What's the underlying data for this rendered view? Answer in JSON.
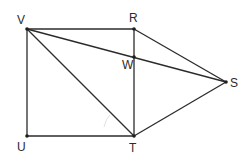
{
  "figure": {
    "type": "geometry",
    "points": {
      "V": {
        "x": 27,
        "y": 29,
        "label": "V",
        "lx": 17,
        "ly": 24
      },
      "R": {
        "x": 134,
        "y": 29,
        "label": "R",
        "lx": 129,
        "ly": 22
      },
      "W": {
        "x": 134,
        "y": 57,
        "label": "W",
        "lx": 122,
        "ly": 69
      },
      "S": {
        "x": 226,
        "y": 82,
        "label": "S",
        "lx": 230,
        "ly": 87
      },
      "U": {
        "x": 27,
        "y": 136,
        "label": "U",
        "lx": 17,
        "ly": 151
      },
      "T": {
        "x": 134,
        "y": 136,
        "label": "T",
        "lx": 129,
        "ly": 152
      }
    },
    "segments": [
      [
        "V",
        "R"
      ],
      [
        "V",
        "U"
      ],
      [
        "U",
        "T"
      ],
      [
        "R",
        "T"
      ],
      [
        "V",
        "T"
      ],
      [
        "V",
        "S"
      ],
      [
        "R",
        "S"
      ],
      [
        "T",
        "S"
      ]
    ],
    "labels": [
      "V",
      "R",
      "W",
      "S",
      "U",
      "T"
    ]
  }
}
